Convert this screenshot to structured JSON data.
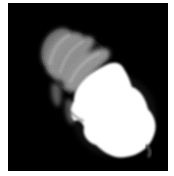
{
  "image": {
    "subject": "Glowing compact fluorescent spiral light bulb on black background",
    "background_color": "#000000",
    "border_color": "#ffffff",
    "glow_color": "#ffffff",
    "coil_color": "#8a8a8a"
  }
}
